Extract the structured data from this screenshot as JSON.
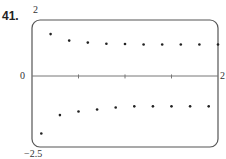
{
  "problem": {
    "number": "41."
  },
  "axis_labels": {
    "y_max": "2",
    "y_min": "−2.5",
    "x_origin": "0",
    "x_max": "2"
  },
  "colors": {
    "frame": "#555555",
    "axis": "#777777",
    "dot": "#222222"
  },
  "chart_data": {
    "type": "scatter",
    "title": "",
    "xlabel": "",
    "ylabel": "",
    "xlim": [
      0,
      2
    ],
    "ylim": [
      -2.5,
      2
    ],
    "grid": false,
    "x_ticks": [
      0.5,
      1,
      1.5
    ],
    "tick_labels": {
      "x": [
        "0",
        "2"
      ],
      "y": [
        "2",
        "-2.5"
      ]
    },
    "series": [
      {
        "name": "upper points",
        "x": [
          0.2,
          0.4,
          0.6,
          0.8,
          1.0,
          1.2,
          1.4,
          1.6,
          1.8,
          2.0
        ],
        "y": [
          1.5,
          1.27,
          1.2,
          1.16,
          1.15,
          1.13,
          1.13,
          1.13,
          1.13,
          1.13
        ]
      },
      {
        "name": "lower points",
        "x": [
          0.1,
          0.3,
          0.5,
          0.7,
          0.9,
          1.1,
          1.3,
          1.5,
          1.7,
          1.9
        ],
        "y": [
          -2.02,
          -1.37,
          -1.24,
          -1.17,
          -1.1,
          -1.06,
          -1.06,
          -1.06,
          -1.06,
          -1.06
        ]
      }
    ]
  }
}
